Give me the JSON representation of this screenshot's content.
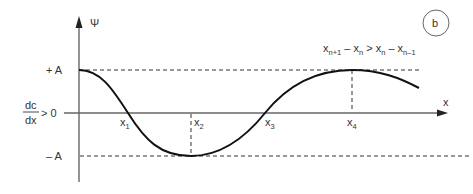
{
  "panel_label": "b",
  "axes": {
    "y_label": "Ψ",
    "x_label": "x"
  },
  "levels": {
    "plus_a": "+ A",
    "minus_a": "– A"
  },
  "gradient": {
    "numerator": "dc",
    "denominator": "dx",
    "relation": "> 0"
  },
  "points": [
    {
      "base": "x",
      "sub": "1"
    },
    {
      "base": "x",
      "sub": "2"
    },
    {
      "base": "x",
      "sub": "3"
    },
    {
      "base": "x",
      "sub": "4"
    }
  ],
  "inequality": {
    "t1": "x",
    "t1_sub": "n+1",
    "op1": " – ",
    "t2": "x",
    "t2_sub": "n",
    "op2": " > ",
    "t3": "x",
    "t3_sub": "n",
    "op3": " – ",
    "t4": "x",
    "t4_sub": "n–1"
  },
  "colors": {
    "axis": "#555555",
    "curve": "#111111",
    "dash": "#333333",
    "text": "#333333"
  }
}
